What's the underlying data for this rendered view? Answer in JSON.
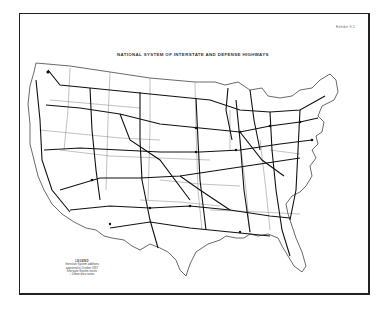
{
  "map": {
    "exhibit_label": "Exhibit 9-1",
    "title": "NATIONAL SYSTEM OF INTERSTATE AND DEFENSE HIGHWAYS",
    "legend": {
      "title": "LEGEND",
      "line1": "Interstate System additions",
      "line2": "approved in October 1957",
      "line3": "Interstate System routes",
      "circle_label": "Urban area routes"
    },
    "colors": {
      "ink": "#222222",
      "paper": "#ffffff",
      "border": "#222222"
    }
  }
}
